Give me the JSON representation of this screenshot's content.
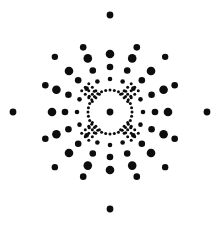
{
  "figure": {
    "caption": "",
    "background_color": "#ffffff",
    "dot_color": "#0d0d0d",
    "width": 222,
    "height": 239
  },
  "chart_data": {
    "type": "scatter",
    "subtitle": "",
    "xlabel": "",
    "ylabel": "",
    "xlim": [
      0,
      222
    ],
    "ylim": [
      0,
      239
    ],
    "grid": false,
    "legend": null,
    "annotations": [],
    "marker_color": "#0d0d0d",
    "background": "#ffffff",
    "center": {
      "x": 110.0,
      "y": 112.0
    },
    "symmetry_order": 8,
    "rings": [
      {
        "name": "center",
        "radius": 0.0,
        "marker_radius": 3.4,
        "count": 1,
        "angles_deg": [
          0
        ]
      },
      {
        "name": "inner-micro-ring",
        "radius": 22.0,
        "marker_radius": 1.5,
        "count": 32,
        "angles_deg": [
          0,
          11.25,
          22.5,
          33.75,
          45,
          56.25,
          67.5,
          78.75,
          90,
          101.25,
          112.5,
          123.75,
          135,
          146.25,
          157.5,
          168.75,
          180,
          191.25,
          202.5,
          213.75,
          225,
          236.25,
          247.5,
          258.75,
          270,
          281.25,
          292.5,
          303.75,
          315,
          326.25,
          337.5,
          348.75
        ]
      },
      {
        "name": "diagonal-micro-cluster",
        "radius": 26.0,
        "marker_radius": 1.6,
        "count": 16,
        "angles_deg": [
          37,
          53,
          127,
          143,
          217,
          233,
          307,
          323
        ]
      },
      {
        "name": "mid-ring-small",
        "radius": 33.0,
        "marker_radius": 2.3,
        "count": 16,
        "angles_deg": [
          0,
          22.5,
          45,
          67.5,
          90,
          112.5,
          135,
          157.5,
          180,
          202.5,
          225,
          247.5,
          270,
          292.5,
          315,
          337.5
        ]
      },
      {
        "name": "mid-ring-medium",
        "radius": 45.0,
        "marker_radius": 3.3,
        "count": 16,
        "angles_deg": [
          0,
          22.5,
          45,
          67.5,
          90,
          112.5,
          135,
          157.5,
          180,
          202.5,
          225,
          247.5,
          270,
          292.5,
          315,
          337.5
        ]
      },
      {
        "name": "outer-ring-large",
        "radius": 58.0,
        "marker_radius": 4.3,
        "count": 16,
        "angles_deg": [
          0,
          22.5,
          45,
          67.5,
          90,
          112.5,
          135,
          157.5,
          180,
          202.5,
          225,
          247.5,
          270,
          292.5,
          315,
          337.5
        ]
      },
      {
        "name": "sparse-ring",
        "radius": 70.0,
        "marker_radius": 3.3,
        "count": 8,
        "angles_deg": [
          22.5,
          67.5,
          112.5,
          157.5,
          202.5,
          247.5,
          292.5,
          337.5
        ]
      },
      {
        "name": "outermost-cardinal",
        "radius": 97.0,
        "marker_radius": 3.4,
        "count": 4,
        "angles_deg": [
          0,
          90,
          180,
          270
        ]
      },
      {
        "name": "outermost-diagonal",
        "radius": 78.0,
        "marker_radius": 3.2,
        "count": 4,
        "angles_deg": [
          45,
          135,
          225,
          315
        ]
      }
    ],
    "marker_count_total": 113,
    "marker_radius_range": [
      1.5,
      4.3
    ]
  }
}
